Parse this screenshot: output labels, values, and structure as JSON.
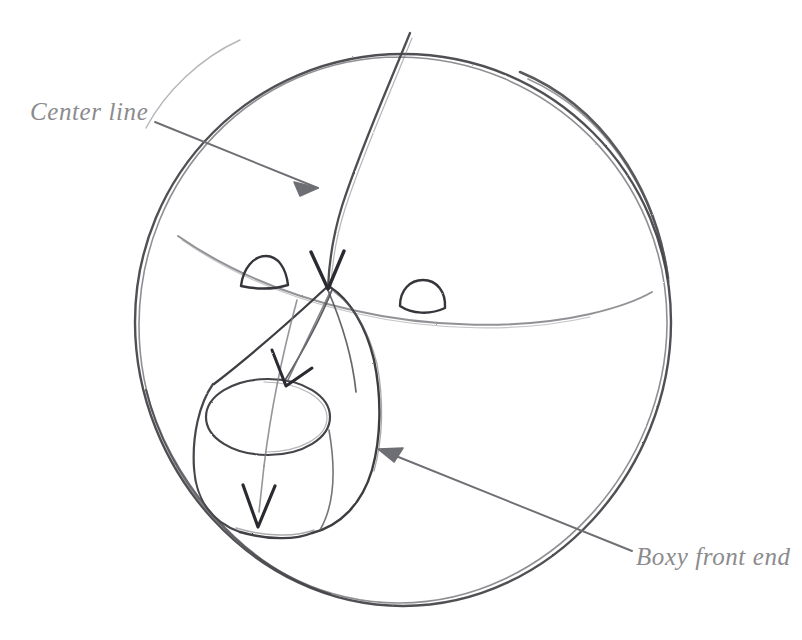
{
  "canvas": {
    "width": 802,
    "height": 640,
    "background_color": "#ffffff",
    "medium": "pencil-sketch"
  },
  "palette": {
    "graphite_dark": "#3a3a3c",
    "graphite_mid": "#58585c",
    "graphite_light": "#86868a",
    "label_text": "#8b8b8e",
    "annotation_line": "#6e6e72"
  },
  "annotations": [
    {
      "id": "center-line",
      "label": "Center line",
      "text_position": {
        "x": 30,
        "y": 98
      },
      "arrow": {
        "from": {
          "x": 155,
          "y": 122
        },
        "to": {
          "x": 327,
          "y": 192
        },
        "direction": "down-right",
        "head": "solid-triangle"
      }
    },
    {
      "id": "boxy-front-end",
      "label": "Boxy front end",
      "text_position": {
        "x": 636,
        "y": 543
      },
      "arrow": {
        "from": {
          "x": 632,
          "y": 551
        },
        "to": {
          "x": 378,
          "y": 449
        },
        "direction": "up-left",
        "head": "solid-triangle"
      }
    }
  ],
  "drawing": {
    "title": "Animal head construction sketch",
    "shapes": [
      {
        "name": "head-sphere",
        "type": "circle",
        "cx": 403,
        "cy": 322,
        "r": 268
      },
      {
        "name": "vertical-center-line",
        "type": "curve",
        "from": {
          "x": 410,
          "y": 33
        },
        "to": {
          "x": 327,
          "y": 288
        }
      },
      {
        "name": "horizontal-brow-line",
        "type": "curve",
        "from": {
          "x": 178,
          "y": 236
        },
        "to": {
          "x": 516,
          "y": 315
        }
      },
      {
        "name": "left-eye",
        "type": "rounded-triangle",
        "cx": 264,
        "cy": 272
      },
      {
        "name": "right-eye",
        "type": "rounded-triangle",
        "cx": 421,
        "cy": 297
      },
      {
        "name": "muzzle-box",
        "type": "boxy-form",
        "apex": {
          "x": 327,
          "y": 286
        }
      },
      {
        "name": "nose-circle",
        "type": "ellipse",
        "cx": 268,
        "cy": 417,
        "rx": 62,
        "ry": 40
      },
      {
        "name": "muzzle-center-arrow",
        "type": "arrow",
        "from": {
          "x": 330,
          "y": 290
        },
        "to": {
          "x": 258,
          "y": 527
        }
      },
      {
        "name": "muzzle-guide-arrow",
        "type": "arrow",
        "from": {
          "x": 327,
          "y": 290
        },
        "to": {
          "x": 282,
          "y": 382
        }
      }
    ]
  }
}
